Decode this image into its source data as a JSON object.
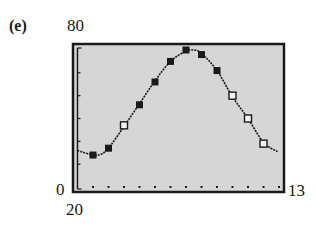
{
  "figure": {
    "part_label": "(e)",
    "window": {
      "xmin_label": "0",
      "xmax_label": "13",
      "ymin_label": "20",
      "ymax_label": "80"
    }
  },
  "colors": {
    "screen_bg": "#d6d6d6",
    "frame": "#1a1a1a",
    "curve": "#1a1a1a",
    "filled_marker": "#1a1a1a",
    "open_marker_fill": "#f2f2f2"
  },
  "chart_data": {
    "type": "scatter",
    "title": "",
    "xlabel": "",
    "ylabel": "",
    "xlim": [
      0,
      13
    ],
    "ylim": [
      20,
      80
    ],
    "x_tick_step": 1,
    "y_tick_step": 10,
    "grid": false,
    "series": [
      {
        "name": "data points (filled)",
        "marker": "filled-square",
        "x": [
          1,
          2,
          4,
          5,
          6,
          7,
          8,
          9
        ],
        "y": [
          34,
          37,
          56,
          66,
          75,
          80,
          78,
          71
        ]
      },
      {
        "name": "data points (open)",
        "marker": "open-square",
        "x": [
          3,
          10,
          11,
          12
        ],
        "y": [
          47,
          60,
          50,
          39
        ]
      },
      {
        "name": "fitted sine model",
        "type": "line",
        "x": [
          0,
          1,
          1.5,
          2,
          3,
          4,
          5,
          6,
          7,
          7.5,
          8,
          9,
          10,
          11,
          12,
          12.9
        ],
        "y": [
          36,
          34,
          34.3,
          37,
          46.5,
          56.5,
          66.5,
          75,
          79.5,
          80,
          78.5,
          71,
          59.5,
          50,
          39.5,
          35.5
        ]
      }
    ]
  }
}
